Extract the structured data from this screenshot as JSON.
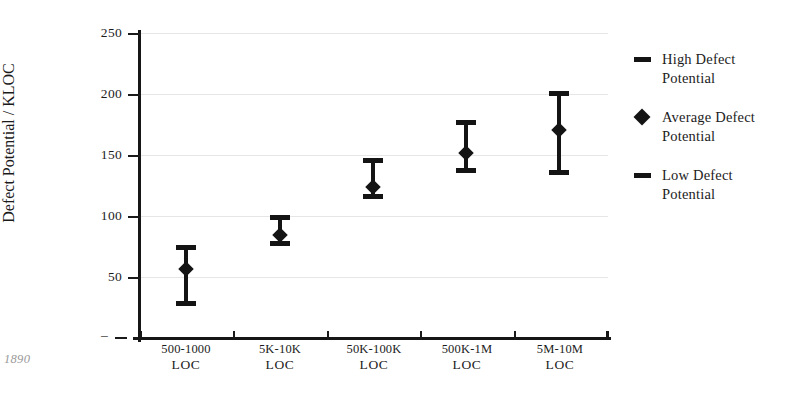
{
  "chart_data": {
    "type": "scatter",
    "title": "",
    "subtitle": "",
    "xlabel": "",
    "ylabel": "Defect Potential / KLOC",
    "ylim": [
      0,
      250
    ],
    "ytick_values": [
      0,
      50,
      100,
      150,
      200,
      250
    ],
    "ytick_labels": [
      "–",
      "50",
      "100",
      "150",
      "200",
      "250"
    ],
    "grid": "horizontal",
    "legend_position": "right",
    "categories": [
      "500-1000 LOC",
      "5K-10K LOC",
      "50K-100K LOC",
      "500K-1M LOC",
      "5M-10M LOC"
    ],
    "category_lines": [
      {
        "top": "500-1000",
        "bottom": "LOC"
      },
      {
        "top": "5K-10K",
        "bottom": "LOC"
      },
      {
        "top": "50K-100K",
        "bottom": "LOC"
      },
      {
        "top": "500K-1M",
        "bottom": "LOC"
      },
      {
        "top": "5M-10M",
        "bottom": "LOC"
      }
    ],
    "series": [
      {
        "name": "High Defect Potential",
        "marker": "dash",
        "values": [
          75,
          100,
          146,
          177,
          201
        ]
      },
      {
        "name": "Average Defect Potential",
        "marker": "diamond",
        "values": [
          57,
          85,
          124,
          152,
          171
        ]
      },
      {
        "name": "Low Defect Potential",
        "marker": "dash",
        "values": [
          29,
          78,
          116,
          137,
          136
        ]
      }
    ],
    "points": [
      {
        "category": "500-1000 LOC",
        "low": 29,
        "average": 57,
        "high": 75
      },
      {
        "category": "5K-10K LOC",
        "low": 78,
        "average": 85,
        "high": 100
      },
      {
        "category": "50K-100K LOC",
        "low": 116,
        "average": 124,
        "high": 146
      },
      {
        "category": "500K-1M LOC",
        "low": 137,
        "average": 152,
        "high": 177
      },
      {
        "category": "5M-10M LOC",
        "low": 136,
        "average": 171,
        "high": 201
      }
    ],
    "legend": [
      {
        "label_line1": "High Defect",
        "label_line2": "Potential",
        "marker": "dash"
      },
      {
        "label_line1": "Average Defect",
        "label_line2": "Potential",
        "marker": "diamond"
      },
      {
        "label_line1": "Low Defect",
        "label_line2": "Potential",
        "marker": "dash"
      }
    ],
    "colors": {
      "series": "#141414",
      "axis": "#161616",
      "grid": "#e6e6e6",
      "text": "#1c1c1c",
      "background": "#ffffff",
      "footnote": "#9a9a9a"
    }
  },
  "footnote": "1890"
}
